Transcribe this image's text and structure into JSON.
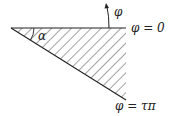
{
  "diagram": {
    "type": "wedge-geometry",
    "labels": {
      "phi_arrow": "φ",
      "upper_boundary": "φ = 0",
      "lower_boundary": "φ = τπ",
      "angle": "α"
    },
    "colors": {
      "stroke": "#222222",
      "background": "#ffffff"
    }
  }
}
